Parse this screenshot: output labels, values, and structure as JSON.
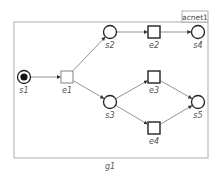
{
  "diagram": {
    "net_name": "acnet1",
    "group_label": "g1",
    "colors": {
      "frame": "#9a9a9a",
      "node": "#222222",
      "arc": "#777777",
      "label": "#555555",
      "token": "#111111"
    },
    "places": [
      {
        "id": "s1",
        "label": "s1",
        "x": 24,
        "y": 77,
        "marked": true
      },
      {
        "id": "s2",
        "label": "s2",
        "x": 110,
        "y": 32,
        "marked": false
      },
      {
        "id": "s3",
        "label": "s3",
        "x": 110,
        "y": 102,
        "marked": false
      },
      {
        "id": "s4",
        "label": "s4",
        "x": 198,
        "y": 32,
        "marked": false
      },
      {
        "id": "s5",
        "label": "s5",
        "x": 198,
        "y": 102,
        "marked": false
      }
    ],
    "events": [
      {
        "id": "e1",
        "label": "e1",
        "x": 67,
        "y": 77,
        "style": "light"
      },
      {
        "id": "e2",
        "label": "e2",
        "x": 154,
        "y": 32,
        "style": "bold"
      },
      {
        "id": "e3",
        "label": "e3",
        "x": 154,
        "y": 77,
        "style": "bold"
      },
      {
        "id": "e4",
        "label": "e4",
        "x": 154,
        "y": 128,
        "style": "bold"
      }
    ],
    "arcs": [
      [
        "s1",
        "e1"
      ],
      [
        "e1",
        "s2"
      ],
      [
        "e1",
        "s3"
      ],
      [
        "s2",
        "e2"
      ],
      [
        "e2",
        "s4"
      ],
      [
        "s3",
        "e3"
      ],
      [
        "s3",
        "e4"
      ],
      [
        "e3",
        "s5"
      ],
      [
        "e4",
        "s5"
      ]
    ]
  }
}
